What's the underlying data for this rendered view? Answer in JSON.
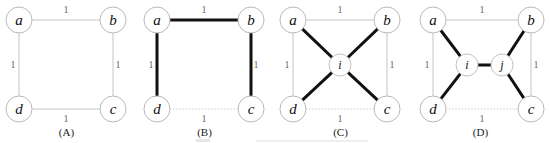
{
  "figure": {
    "background_color": "#ffffff",
    "thin_edge_color": "#c4c4c4",
    "thick_edge_color": "#111111",
    "node_fill_color": "#ffffff",
    "node_stroke_color": "#b9b9b9",
    "weight_text_color": "#6a6a6a",
    "panel_count": 4
  },
  "panels": [
    {
      "id": "panel-a",
      "caption": "(A)",
      "nodes": [
        {
          "id": "a",
          "label": "a",
          "x": 19,
          "y": 20,
          "r": 13,
          "size": "large"
        },
        {
          "id": "b",
          "label": "b",
          "x": 113,
          "y": 20,
          "r": 13,
          "size": "large"
        },
        {
          "id": "c",
          "label": "c",
          "x": 113,
          "y": 109,
          "r": 13,
          "size": "large"
        },
        {
          "id": "d",
          "label": "d",
          "x": 19,
          "y": 109,
          "r": 13,
          "size": "large"
        }
      ],
      "edges": [
        {
          "from": "a",
          "to": "b",
          "style": "thin",
          "weight": "1",
          "wx": 66,
          "wy": 13
        },
        {
          "from": "b",
          "to": "c",
          "style": "thin",
          "weight": "1",
          "wx": 118,
          "wy": 68
        },
        {
          "from": "d",
          "to": "c",
          "style": "thin",
          "weight": "1",
          "wx": 66,
          "wy": 122
        },
        {
          "from": "a",
          "to": "d",
          "style": "thin",
          "weight": "1",
          "wx": 13,
          "wy": 68
        }
      ]
    },
    {
      "id": "panel-b",
      "caption": "(B)",
      "nodes": [
        {
          "id": "a",
          "label": "a",
          "x": 19,
          "y": 20,
          "r": 13,
          "size": "large"
        },
        {
          "id": "b",
          "label": "b",
          "x": 113,
          "y": 20,
          "r": 13,
          "size": "large"
        },
        {
          "id": "c",
          "label": "c",
          "x": 113,
          "y": 109,
          "r": 13,
          "size": "large"
        },
        {
          "id": "d",
          "label": "d",
          "x": 19,
          "y": 109,
          "r": 13,
          "size": "large"
        }
      ],
      "edges": [
        {
          "from": "a",
          "to": "b",
          "style": "thick",
          "weight": "1",
          "wx": 66,
          "wy": 13
        },
        {
          "from": "b",
          "to": "c",
          "style": "thick",
          "weight": "1",
          "wx": 118,
          "wy": 68
        },
        {
          "from": "d",
          "to": "c",
          "style": "dotted",
          "weight": "1",
          "wx": 66,
          "wy": 122
        },
        {
          "from": "a",
          "to": "d",
          "style": "thick",
          "weight": "1",
          "wx": 13,
          "wy": 68
        }
      ]
    },
    {
      "id": "panel-c",
      "caption": "(C)",
      "nodes": [
        {
          "id": "a",
          "label": "a",
          "x": 19,
          "y": 20,
          "r": 13,
          "size": "large"
        },
        {
          "id": "b",
          "label": "b",
          "x": 113,
          "y": 20,
          "r": 13,
          "size": "large"
        },
        {
          "id": "c",
          "label": "c",
          "x": 113,
          "y": 109,
          "r": 13,
          "size": "large"
        },
        {
          "id": "d",
          "label": "d",
          "x": 19,
          "y": 109,
          "r": 13,
          "size": "large"
        },
        {
          "id": "i",
          "label": "i",
          "x": 66,
          "y": 65,
          "r": 11,
          "size": "small"
        }
      ],
      "edges": [
        {
          "from": "a",
          "to": "b",
          "style": "thin",
          "weight": "1",
          "wx": 66,
          "wy": 13
        },
        {
          "from": "b",
          "to": "c",
          "style": "thin",
          "weight": "1",
          "wx": 118,
          "wy": 68
        },
        {
          "from": "d",
          "to": "c",
          "style": "dotted",
          "weight": "1",
          "wx": 66,
          "wy": 122
        },
        {
          "from": "a",
          "to": "d",
          "style": "thin",
          "weight": "1",
          "wx": 13,
          "wy": 68
        },
        {
          "from": "a",
          "to": "i",
          "style": "thick",
          "weight": "",
          "wx": 0,
          "wy": 0
        },
        {
          "from": "b",
          "to": "i",
          "style": "thick",
          "weight": "",
          "wx": 0,
          "wy": 0
        },
        {
          "from": "c",
          "to": "i",
          "style": "thick",
          "weight": "",
          "wx": 0,
          "wy": 0
        },
        {
          "from": "d",
          "to": "i",
          "style": "thick",
          "weight": "",
          "wx": 0,
          "wy": 0
        }
      ]
    },
    {
      "id": "panel-d",
      "caption": "(D)",
      "nodes": [
        {
          "id": "a",
          "label": "a",
          "x": 19,
          "y": 20,
          "r": 13,
          "size": "large"
        },
        {
          "id": "b",
          "label": "b",
          "x": 117,
          "y": 20,
          "r": 13,
          "size": "large"
        },
        {
          "id": "c",
          "label": "c",
          "x": 117,
          "y": 109,
          "r": 13,
          "size": "large"
        },
        {
          "id": "d",
          "label": "d",
          "x": 19,
          "y": 109,
          "r": 13,
          "size": "large"
        },
        {
          "id": "i",
          "label": "i",
          "x": 53,
          "y": 65,
          "r": 11,
          "size": "small"
        },
        {
          "id": "j",
          "label": "j",
          "x": 88,
          "y": 65,
          "r": 11,
          "size": "small"
        }
      ],
      "edges": [
        {
          "from": "a",
          "to": "b",
          "style": "thin",
          "weight": "1",
          "wx": 68,
          "wy": 13
        },
        {
          "from": "b",
          "to": "c",
          "style": "thin",
          "weight": "1",
          "wx": 122,
          "wy": 68
        },
        {
          "from": "d",
          "to": "c",
          "style": "dotted",
          "weight": "1",
          "wx": 68,
          "wy": 122
        },
        {
          "from": "a",
          "to": "d",
          "style": "thin",
          "weight": "1",
          "wx": 13,
          "wy": 68
        },
        {
          "from": "a",
          "to": "i",
          "style": "thick",
          "weight": "",
          "wx": 0,
          "wy": 0
        },
        {
          "from": "d",
          "to": "i",
          "style": "thick",
          "weight": "",
          "wx": 0,
          "wy": 0
        },
        {
          "from": "i",
          "to": "j",
          "style": "thick",
          "weight": "",
          "wx": 0,
          "wy": 0
        },
        {
          "from": "b",
          "to": "j",
          "style": "thick",
          "weight": "",
          "wx": 0,
          "wy": 0
        },
        {
          "from": "c",
          "to": "j",
          "style": "thick",
          "weight": "",
          "wx": 0,
          "wy": 0
        }
      ]
    }
  ],
  "panel_offsets": [
    0,
    138,
    274,
    414
  ],
  "panel_width": 137,
  "caption_y": 136
}
